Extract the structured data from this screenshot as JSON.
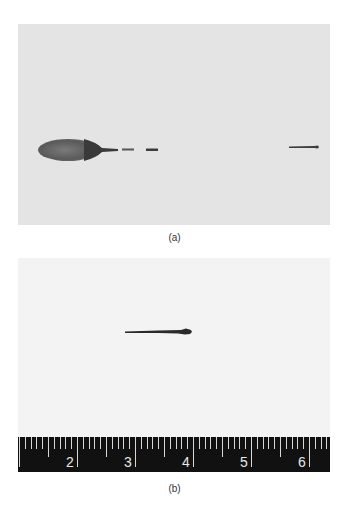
{
  "figure": {
    "panels": [
      {
        "id": "a",
        "caption": "(a)",
        "description": "Gray background photograph showing a dark elongated ellipsoidal body on the left with a thin trailing streak and two small dash fragments, and a thin rod-like streak on the right."
      },
      {
        "id": "b",
        "caption": "(b)",
        "description": "Light background photograph showing a single thin dark needle-like object with a bulbous right end, above a black ruler scale.",
        "ruler": {
          "labels": [
            "2",
            "3",
            "4",
            "5",
            "6"
          ]
        }
      }
    ]
  }
}
